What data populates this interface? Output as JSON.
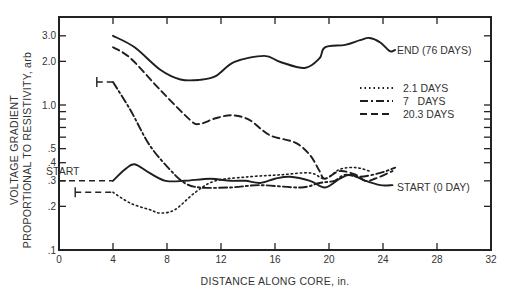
{
  "chart_data": {
    "type": "line",
    "title": "",
    "xlabel": "DISTANCE ALONG CORE, in.",
    "ylabel_line1": "VOLTAGE GRADIENT",
    "ylabel_line2": "PROPORTIONAL TO RESISTIVITY, arb",
    "xlim": [
      0,
      32
    ],
    "ylim": [
      0.1,
      4.0
    ],
    "yscale": "log",
    "grid": false,
    "x_ticks": [
      0,
      4,
      8,
      12,
      16,
      20,
      24,
      28,
      32
    ],
    "x_tick_labels": [
      "0",
      "4",
      "8",
      "12",
      "16",
      "20",
      "24",
      "28",
      "32"
    ],
    "y_ticks": [
      0.1,
      0.2,
      0.3,
      0.4,
      0.5,
      1.0,
      2.0,
      3.0
    ],
    "y_tick_labels": [
      ".1",
      ".2",
      ".3",
      ".4",
      ".5",
      "1.0",
      "2.0",
      "3.0"
    ],
    "y_minor_ticks": [
      0.6,
      0.7,
      0.8,
      0.9
    ],
    "legend": {
      "position": "upper-right-inside",
      "entries": [
        {
          "label": "2.1 DAYS",
          "style": "dotted"
        },
        {
          "label": "7   DAYS",
          "style": "dash-dot"
        },
        {
          "label": "20.3 DAYS",
          "style": "dashed"
        }
      ]
    },
    "annotations": [
      {
        "text": "END (76 DAYS)",
        "x": 25.2,
        "y": 2.35
      },
      {
        "text": "START (0 DAY)",
        "x": 25.2,
        "y": 0.28
      },
      {
        "text": "START",
        "x": 1.0,
        "y": 0.33
      }
    ],
    "series": [
      {
        "name": "END (76 DAYS)",
        "style": "solid",
        "x": [
          4,
          5.6,
          7.5,
          9,
          10.4,
          11.6,
          13,
          15.2,
          16.4,
          18.2,
          19.3,
          19.7,
          21.2,
          22.3,
          23,
          23.8,
          24.5,
          24.9
        ],
        "y": [
          3.0,
          2.5,
          1.75,
          1.5,
          1.49,
          1.58,
          1.98,
          2.18,
          1.98,
          1.8,
          2.1,
          2.5,
          2.6,
          2.8,
          2.9,
          2.7,
          2.35,
          2.4
        ]
      },
      {
        "name": "20.3 DAYS",
        "style": "dashed",
        "x": [
          4,
          5.3,
          7.5,
          9.7,
          10.4,
          11.6,
          12.8,
          14.1,
          15.6,
          17.5,
          18.6,
          19.3,
          19.7,
          20.8,
          22,
          22.7,
          23.4,
          24.7
        ],
        "y": [
          2.5,
          2.1,
          1.27,
          0.79,
          0.74,
          0.81,
          0.85,
          0.79,
          0.62,
          0.55,
          0.45,
          0.35,
          0.31,
          0.35,
          0.33,
          0.3,
          0.31,
          0.35
        ]
      },
      {
        "name": "7 DAYS",
        "style": "dash-dot",
        "initial_flat": {
          "x": [
            2.8,
            4
          ],
          "y": 1.44
        },
        "x": [
          4,
          5.3,
          6.7,
          8.2,
          9.3,
          10.4,
          12.7,
          14.9,
          17.9,
          19.3,
          20.4,
          21.2,
          22.3,
          23.8,
          24.9
        ],
        "y": [
          1.44,
          0.92,
          0.53,
          0.36,
          0.29,
          0.27,
          0.27,
          0.28,
          0.27,
          0.29,
          0.3,
          0.33,
          0.32,
          0.34,
          0.37
        ]
      },
      {
        "name": "2.1 DAYS",
        "style": "dotted",
        "initial_flat": {
          "x": [
            1.2,
            4
          ],
          "y": 0.25
        },
        "x": [
          4,
          5.3,
          6.7,
          7.5,
          8.6,
          10.1,
          11.6,
          14.1,
          16.4,
          18.6,
          19.7,
          20.8,
          22,
          23
        ],
        "y": [
          0.25,
          0.21,
          0.19,
          0.18,
          0.19,
          0.25,
          0.3,
          0.32,
          0.33,
          0.34,
          0.31,
          0.36,
          0.37,
          0.35
        ]
      },
      {
        "name": "START (0 DAY)",
        "style": "solid",
        "initial_flat": {
          "x": [
            0,
            4
          ],
          "y": 0.3
        },
        "x": [
          4,
          4.9,
          5.6,
          6.7,
          7.9,
          9.3,
          11.2,
          12.7,
          13.8,
          14.9,
          16,
          17.1,
          18.6,
          19.7,
          20.8,
          21.6,
          22.7,
          23.8,
          24.7
        ],
        "y": [
          0.3,
          0.36,
          0.39,
          0.34,
          0.3,
          0.3,
          0.31,
          0.3,
          0.3,
          0.29,
          0.31,
          0.32,
          0.3,
          0.27,
          0.31,
          0.33,
          0.3,
          0.28,
          0.28
        ]
      }
    ]
  }
}
